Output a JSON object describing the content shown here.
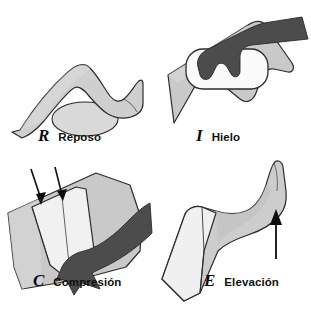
{
  "figure": {
    "background_color": "#ffffff",
    "palette": {
      "limb_fill": "#cfcfcf",
      "limb_fill_light": "#d8d8d8",
      "pack_fill": "#f2f2f2",
      "bandage_fill": "#efefef",
      "hand_fill": "#4c4c4c",
      "outline": "#2b2b2b",
      "arrow": "#0d0d0d",
      "text": "#101010"
    }
  },
  "panels": [
    {
      "id": "reposo",
      "letter": "R",
      "label": "Reposo",
      "icon": "leg-resting-on-pillow-icon",
      "elements": [
        "bent-leg",
        "pillow-ellipse"
      ]
    },
    {
      "id": "hielo",
      "letter": "I",
      "label": "Hielo",
      "icon": "hand-holding-ice-pack-on-knee-icon",
      "elements": [
        "bent-knee",
        "ice-pack",
        "hand-and-arm"
      ]
    },
    {
      "id": "compresion",
      "letter": "C",
      "label": "Compresión",
      "icon": "hand-wrapping-elastic-bandage-icon",
      "elements": [
        "leg",
        "elastic-bandage",
        "hand-and-arm",
        "pressure-arrow-left",
        "pressure-arrow-right"
      ]
    },
    {
      "id": "elevacion",
      "letter": "E",
      "label": "Elevación",
      "icon": "raised-leg-with-up-arrow-icon",
      "elements": [
        "raised-leg",
        "thigh-wrap",
        "up-arrow"
      ]
    }
  ]
}
